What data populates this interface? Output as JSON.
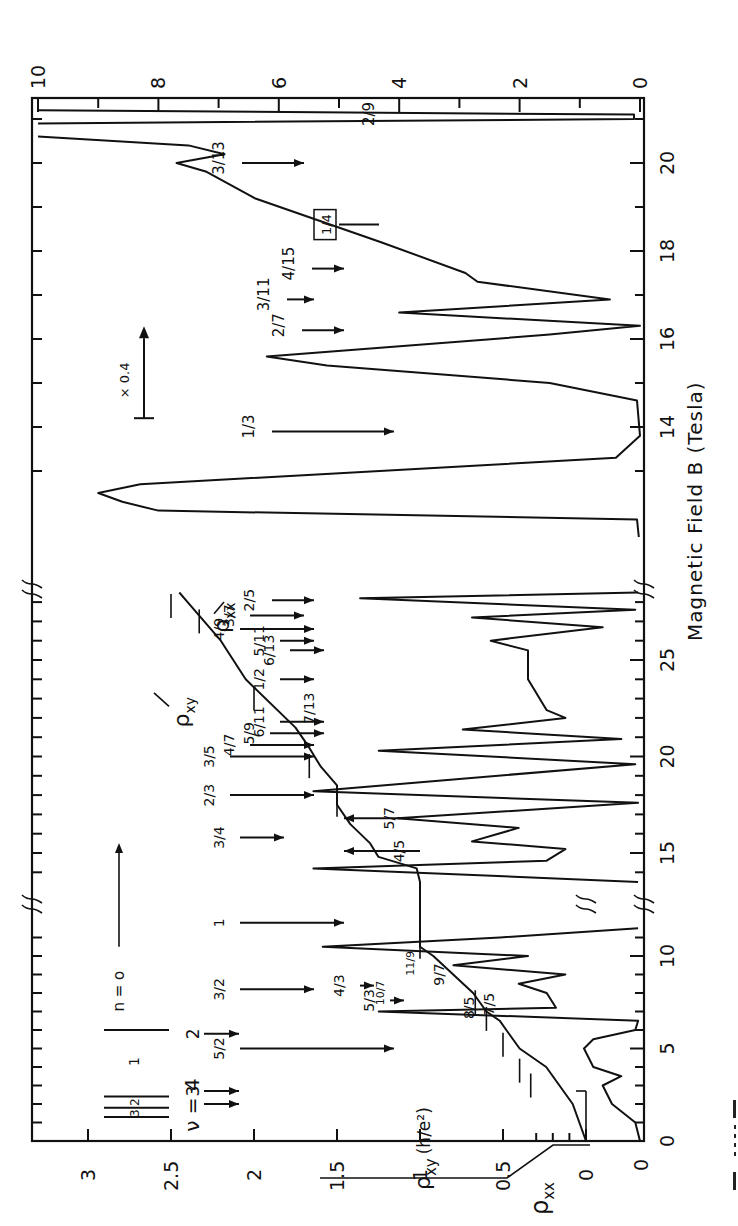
{
  "figure": {
    "caption_fragment": "Fig. 1.1.1",
    "orientation": "rotated 90 degrees counter-clockwise"
  },
  "chart_data": {
    "type": "line",
    "title": "",
    "xlabel": "Magnetic Field B (Tesla)",
    "ylabel_left": "ρxy (h/e²)",
    "ylabel_left_secondary": "ρxx",
    "ylabel_right": "Resistivity ρxx (10³ Ω/□)",
    "grid": false,
    "segments": [
      {
        "name": "low-field",
        "x_range": [
          0,
          12
        ],
        "x_ticks": [
          0,
          5,
          10
        ],
        "px_per_tesla": 18.5,
        "u_start": 0
      },
      {
        "name": "mid-field",
        "x_range": [
          12.3,
          28.5
        ],
        "x_ticks": [
          15,
          20,
          25
        ],
        "px_per_tesla": 19.3,
        "u_start": 236
      },
      {
        "name": "high-field (×0.4)",
        "x_range": [
          11.5,
          21.3
        ],
        "x_ticks": [
          12,
          14,
          16,
          18,
          20
        ],
        "px_per_tesla": 44,
        "u_start": 561
      }
    ],
    "y_left_ticks": [
      "0",
      "0.5",
      "1",
      "1.5",
      "2",
      "2.5",
      "3"
    ],
    "y_left_range": [
      0,
      3.3
    ],
    "y_rhoxx_zero_label": "0",
    "y_right_ticks": [
      "0",
      "2",
      "4",
      "6",
      "8",
      "10"
    ],
    "y_right_range": [
      0,
      10
    ],
    "x_tick_labels_low": [
      "0",
      "5",
      "10"
    ],
    "x_tick_labels_mid": [
      "15",
      "20",
      "25"
    ],
    "x_tick_labels_high": [
      "12",
      "14",
      "16",
      "18",
      "20"
    ],
    "scale_annotation": "× 0.4",
    "series": [
      {
        "name": "ρxy",
        "label": "ρxy",
        "unit": "h/e²",
        "points_B_value": [
          [
            0,
            0
          ],
          [
            2,
            0.08
          ],
          [
            4,
            0.24
          ],
          [
            5,
            0.4
          ],
          [
            6,
            0.48
          ],
          [
            6.5,
            0.52
          ],
          [
            7,
            0.6
          ],
          [
            8,
            0.68
          ],
          [
            9,
            0.8
          ],
          [
            10,
            0.92
          ],
          [
            10.5,
            1.0
          ],
          [
            12,
            1.0
          ],
          [
            13.5,
            1.0
          ],
          [
            14.2,
            1.02
          ],
          [
            14.8,
            1.25
          ],
          [
            15.5,
            1.3
          ],
          [
            16.5,
            1.42
          ],
          [
            17.5,
            1.5
          ],
          [
            18.5,
            1.5
          ],
          [
            19.5,
            1.6
          ],
          [
            20.5,
            1.67
          ],
          [
            21.5,
            1.75
          ],
          [
            24,
            2.05
          ],
          [
            26,
            2.2
          ],
          [
            27,
            2.3
          ],
          [
            28,
            2.4
          ],
          [
            28.5,
            2.45
          ]
        ]
      },
      {
        "name": "ρxx",
        "label": "ρxx",
        "unit": "10³ Ω/□",
        "note": "low and mid field in arbitrary units; high field scaled ×0.4",
        "low_field_B_value": [
          [
            0,
            0
          ],
          [
            1,
            0.05
          ],
          [
            2,
            0.3
          ],
          [
            3,
            0.4
          ],
          [
            3.5,
            0.2
          ],
          [
            4,
            0.5
          ],
          [
            5,
            0.6
          ],
          [
            5.5,
            0.5
          ],
          [
            6,
            0.05
          ],
          [
            6.5,
            0.02
          ],
          [
            7,
            2.8
          ],
          [
            7.2,
            0.9
          ],
          [
            8,
            1.0
          ],
          [
            8.5,
            1.3
          ],
          [
            9,
            0.8
          ],
          [
            9.5,
            2.0
          ],
          [
            10,
            1.2
          ],
          [
            10.5,
            3.4
          ],
          [
            11,
            1.5
          ],
          [
            11.5,
            0.02
          ]
        ],
        "mid_field_B_value": [
          [
            13.5,
            0.02
          ],
          [
            14.2,
            3.5
          ],
          [
            14.6,
            1.0
          ],
          [
            15.2,
            0.8
          ],
          [
            15.6,
            1.8
          ],
          [
            16.3,
            1.3
          ],
          [
            16.8,
            2.6
          ],
          [
            17.6,
            0.02
          ],
          [
            18.2,
            3.5
          ],
          [
            19.6,
            0.05
          ],
          [
            20.3,
            2.8
          ],
          [
            20.9,
            0.2
          ],
          [
            21.4,
            1.9
          ],
          [
            22,
            0.8
          ],
          [
            22.4,
            1.0
          ],
          [
            24,
            1.2
          ],
          [
            25.5,
            1.2
          ],
          [
            26,
            1.6
          ],
          [
            26.7,
            0.4
          ],
          [
            27.2,
            1.8
          ],
          [
            27.6,
            0.05
          ],
          [
            28.2,
            3.0
          ],
          [
            28.5,
            0.02
          ]
        ],
        "high_field_B_value": [
          [
            11.5,
            0.02
          ],
          [
            11.9,
            0.05
          ],
          [
            12.1,
            8.0
          ],
          [
            12.3,
            8.6
          ],
          [
            12.5,
            9.0
          ],
          [
            12.7,
            8.3
          ],
          [
            13.3,
            0.4
          ],
          [
            13.8,
            0.0
          ],
          [
            14.6,
            0.05
          ],
          [
            15.0,
            1.5
          ],
          [
            15.4,
            5.2
          ],
          [
            15.6,
            6.2
          ],
          [
            16.1,
            1.5
          ],
          [
            16.3,
            0.0
          ],
          [
            16.6,
            4.0
          ],
          [
            16.9,
            0.5
          ],
          [
            17.3,
            2.7
          ],
          [
            17.5,
            2.9
          ],
          [
            18.2,
            4.3
          ],
          [
            19.2,
            6.4
          ],
          [
            19.8,
            7.2
          ],
          [
            20.0,
            7.7
          ],
          [
            20.2,
            6.9
          ],
          [
            20.4,
            7.5
          ],
          [
            20.6,
            10
          ]
        ]
      }
    ],
    "annotations": {
      "filling_factors_high": [
        "1/3",
        "2/7",
        "3/11",
        "4/15",
        "1/4",
        "3/13",
        "2/9",
        "2/5"
      ],
      "filling_factors_mid": [
        "3/7",
        "4/9",
        "5/11",
        "6/13",
        "1/2",
        "7/13",
        "6/11",
        "5/9",
        "4/7",
        "3/5",
        "2/3",
        "3/4",
        "5/7",
        "4/5"
      ],
      "filling_factors_low": [
        "1",
        "3/2",
        "5/2",
        "4/3",
        "5/3",
        "10/7",
        "11/9",
        "9/7",
        "7/5",
        "8/5"
      ],
      "landau_level_label": "n = o",
      "nu_label": "ν = 4",
      "nu_values": [
        "4",
        "3",
        "2"
      ],
      "spin_levels": [
        "3",
        "2",
        "1"
      ],
      "boxed_label": "1/4"
    }
  },
  "labels": {
    "x_axis_title": "Magnetic   Field  B (Tesla)",
    "right_axis_title": "Resistivity ρ",
    "right_axis_sub": "xx",
    "right_axis_units": "(10³ Ω/□)",
    "left_axis_title": "ρ",
    "left_axis_sub": "xy",
    "left_axis_units": "(h/e²)",
    "rhoxx_left_label": "ρ",
    "rhoxx_left_sub": "xx",
    "rhoxy_curve_label": "ρ",
    "rhoxy_curve_sub": "xy",
    "rhoxx_curve_label": "ρ",
    "rhoxx_curve_sub": "xx",
    "scale": "× 0.4",
    "n_label": "n = o",
    "nu_label": "ν = 4"
  }
}
